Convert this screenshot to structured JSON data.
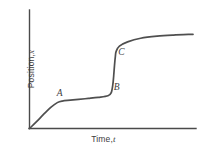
{
  "chart_data": {
    "type": "line",
    "title": "",
    "xlabel": "Time, t",
    "ylabel": "Position, x",
    "xlabel_text": "Time,",
    "xlabel_var": "t",
    "ylabel_text": "Position,",
    "ylabel_var": "x",
    "grid": false,
    "legend": "none",
    "axis_ticks": "none",
    "xlim": [
      0,
      1
    ],
    "ylim": [
      0,
      1
    ],
    "series": [
      {
        "name": "position",
        "description": "Staircase-like position versus time curve: a rising concave segment up to A, a long nearly flat plateau from A to B, a steep near-vertical jump from B to C, then a final flattening plateau.",
        "x": [
          0.0,
          0.04,
          0.09,
          0.13,
          0.17,
          0.2,
          0.25,
          0.3,
          0.36,
          0.42,
          0.48,
          0.5,
          0.51,
          0.515,
          0.52,
          0.525,
          0.53,
          0.55,
          0.6,
          0.68,
          0.78,
          0.88,
          1.0
        ],
        "y": [
          0.0,
          0.06,
          0.14,
          0.2,
          0.245,
          0.26,
          0.268,
          0.276,
          0.285,
          0.295,
          0.31,
          0.34,
          0.42,
          0.5,
          0.6,
          0.68,
          0.73,
          0.78,
          0.82,
          0.855,
          0.875,
          0.885,
          0.892
        ]
      }
    ],
    "annotations": [
      {
        "label": "A",
        "x": 0.2,
        "y": 0.26,
        "position": "above-left",
        "note": "end of initial rise, start of first plateau"
      },
      {
        "label": "B",
        "x": 0.5,
        "y": 0.34,
        "position": "right",
        "note": "start of steep vertical jump"
      },
      {
        "label": "C",
        "x": 0.53,
        "y": 0.73,
        "position": "right",
        "note": "top of steep jump, start of final plateau"
      }
    ]
  },
  "colors": {
    "curve": "#4f4f4f",
    "axis": "#4a4a4a",
    "label": "#3d3d3d",
    "background": "#ffffff"
  }
}
